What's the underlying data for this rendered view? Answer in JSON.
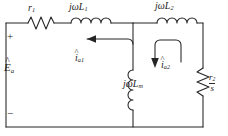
{
  "diagram": {
    "type": "electrical-schematic",
    "background_color": "#ffffff",
    "line_color": "#242424",
    "labels": {
      "stator_resistance": {
        "base": "r",
        "sub": "1"
      },
      "stator_leakage_reactance": {
        "text": "jωL",
        "sub": "1"
      },
      "rotor_leakage_reactance": {
        "text": "jωL",
        "sub": "2"
      },
      "magnetizing_reactance": {
        "text": "jωL",
        "sub": "m"
      },
      "rotor_resistance_over_slip": {
        "numerator_base": "r",
        "numerator_sub": "2",
        "denominator": "s"
      },
      "source_voltage": {
        "base": "E",
        "sub": "a",
        "accent": "^"
      },
      "stator_current": {
        "base": "i",
        "sub": "a1",
        "accent": "^"
      },
      "rotor_current": {
        "base": "i",
        "sub": "a2",
        "accent": "^"
      },
      "terminal_positive": "+",
      "terminal_negative": "−"
    },
    "elements": [
      {
        "name": "source-terminal-positive",
        "kind": "terminal",
        "label": "+"
      },
      {
        "name": "source-terminal-negative",
        "kind": "terminal",
        "label": "−"
      },
      {
        "name": "resistor-r1",
        "kind": "resistor",
        "label": "r1"
      },
      {
        "name": "inductor-jwL1",
        "kind": "inductor",
        "label": "jωL1"
      },
      {
        "name": "inductor-jwL2",
        "kind": "inductor",
        "label": "jωL2"
      },
      {
        "name": "inductor-jwLm",
        "kind": "inductor",
        "label": "jωLm"
      },
      {
        "name": "resistor-r2-over-s",
        "kind": "resistor",
        "label": "r2/s"
      },
      {
        "name": "current-arrow-ia1",
        "kind": "current-arrow",
        "direction": "left"
      },
      {
        "name": "current-arrow-ia2",
        "kind": "current-arrow",
        "direction": "down"
      }
    ]
  }
}
